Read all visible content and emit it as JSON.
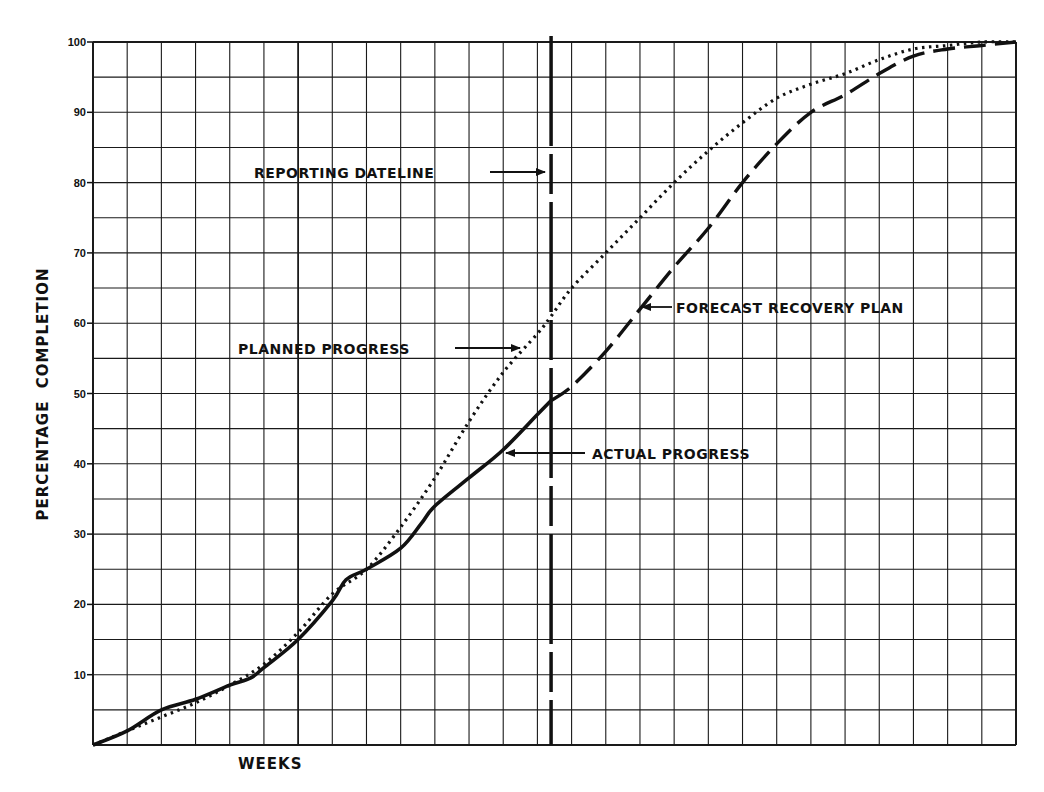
{
  "chart_data": {
    "type": "line",
    "title": "",
    "xlabel": "WEEKS",
    "ylabel": "PERCENTAGE  COMPLETION",
    "xlim": [
      0,
      27
    ],
    "ylim": [
      0,
      100
    ],
    "grid": true,
    "x_grid_step": 1,
    "y_grid_step": 5,
    "y_ticks": [
      10,
      20,
      30,
      40,
      50,
      60,
      70,
      80,
      90,
      100
    ],
    "reporting_dateline_week": 13.4,
    "series": [
      {
        "name": "PLANNED PROGRESS",
        "style": "dotted",
        "x": [
          0,
          1,
          2,
          3,
          4,
          5,
          6,
          7,
          8,
          9,
          10,
          11,
          12,
          13,
          13.4,
          14,
          15,
          16,
          17,
          18,
          19,
          20,
          21,
          22,
          23,
          24,
          25,
          26,
          27
        ],
        "values": [
          0,
          2,
          4,
          6,
          8.5,
          11.5,
          16,
          21.5,
          25,
          31,
          38,
          46,
          53,
          58.5,
          61,
          65,
          70,
          75,
          80,
          84.5,
          88.5,
          92,
          94,
          95.5,
          97.5,
          99,
          99.5,
          100,
          100
        ]
      },
      {
        "name": "ACTUAL PROGRESS",
        "style": "solid",
        "x": [
          0,
          1,
          2,
          3,
          4,
          4.6,
          5,
          6,
          7,
          7.4,
          8,
          9,
          9.6,
          10,
          11,
          12,
          13,
          13.4
        ],
        "values": [
          0,
          2,
          5,
          6.5,
          8.5,
          9.5,
          11,
          15,
          20.5,
          23.5,
          25,
          28,
          31.5,
          34,
          38,
          42,
          47,
          49
        ]
      },
      {
        "name": "FORECAST RECOVERY PLAN",
        "style": "dashed",
        "x": [
          13.4,
          14,
          15,
          16,
          17,
          18,
          19,
          20,
          21,
          22,
          23,
          24,
          25,
          26,
          27
        ],
        "values": [
          49,
          51,
          56,
          62,
          68,
          73.5,
          80,
          85.5,
          90,
          92.5,
          95.5,
          98,
          99,
          99.5,
          100
        ]
      }
    ],
    "annotations": [
      {
        "id": "dateline",
        "text": "REPORTING DATELINE",
        "x_px": 254,
        "y_px": 178,
        "arrow_from": [
          490,
          172
        ],
        "arrow_to": [
          545,
          172
        ]
      },
      {
        "id": "planned",
        "text": "PLANNED PROGRESS",
        "x_px": 238,
        "y_px": 354,
        "arrow_from": [
          455,
          348
        ],
        "arrow_to": [
          520,
          348
        ]
      },
      {
        "id": "forecast",
        "text": "FORECAST RECOVERY PLAN",
        "x_px": 676,
        "y_px": 313,
        "arrow_from": [
          672,
          307
        ],
        "arrow_to": [
          642,
          307
        ]
      },
      {
        "id": "actual",
        "text": "ACTUAL PROGRESS",
        "x_px": 592,
        "y_px": 459,
        "arrow_from": [
          585,
          453
        ],
        "arrow_to": [
          506,
          453
        ]
      }
    ]
  }
}
